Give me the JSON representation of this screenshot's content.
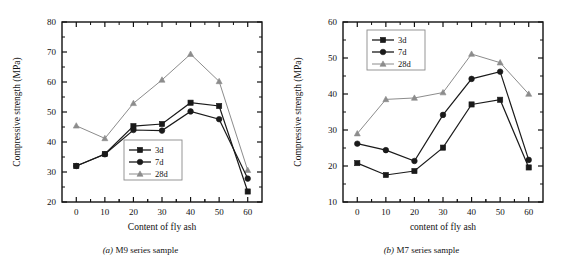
{
  "figure": {
    "background": "#ffffff",
    "ink": "#111111"
  },
  "panels": [
    {
      "key": "panel-a",
      "caption_index": "(a)",
      "caption_text": "M9 series sample",
      "chart_data": {
        "type": "line",
        "title": "",
        "xlabel": "Content of fly ash",
        "ylabel": "Compressive strength (MPa)",
        "x": [
          0,
          10,
          20,
          30,
          40,
          50,
          60
        ],
        "xlim": [
          -5,
          65
        ],
        "ylim": [
          20,
          80
        ],
        "xticks": [
          0,
          10,
          20,
          30,
          40,
          50,
          60
        ],
        "yticks": [
          20,
          30,
          40,
          50,
          60,
          70,
          80
        ],
        "grid": false,
        "legend_position": "center",
        "series": [
          {
            "name": "3d",
            "marker": "square",
            "color": "#1a1a1a",
            "values": [
              32.0,
              36.0,
              45.3,
              46.0,
              53.1,
              52.0,
              23.5
            ]
          },
          {
            "name": "7d",
            "marker": "circle",
            "color": "#1a1a1a",
            "values": [
              32.0,
              35.9,
              44.0,
              43.8,
              50.2,
              47.6,
              27.8
            ]
          },
          {
            "name": "28d",
            "marker": "triangle",
            "color": "#8c8c8c",
            "values": [
              45.4,
              41.2,
              52.9,
              60.7,
              69.3,
              60.2,
              30.6
            ]
          }
        ]
      }
    },
    {
      "key": "panel-b",
      "caption_index": "(b)",
      "caption_text": "M7 series sample",
      "chart_data": {
        "type": "line",
        "title": "",
        "xlabel": "content of fly ash",
        "ylabel": "Compressive strength (MPa)",
        "x": [
          0,
          10,
          20,
          30,
          40,
          50,
          60
        ],
        "xlim": [
          -5,
          65
        ],
        "ylim": [
          10,
          60
        ],
        "xticks": [
          0,
          10,
          20,
          30,
          40,
          50,
          60
        ],
        "yticks": [
          10,
          20,
          30,
          40,
          50,
          60
        ],
        "grid": false,
        "legend_position": "upper left",
        "series": [
          {
            "name": "3d",
            "marker": "square",
            "color": "#1a1a1a",
            "values": [
              20.8,
              17.5,
              18.6,
              25.1,
              37.1,
              38.4,
              19.6
            ]
          },
          {
            "name": "7d",
            "marker": "circle",
            "color": "#1a1a1a",
            "values": [
              26.2,
              24.4,
              21.4,
              34.2,
              44.2,
              46.2,
              21.7
            ]
          },
          {
            "name": "28d",
            "marker": "triangle",
            "color": "#8c8c8c",
            "values": [
              29.0,
              38.5,
              38.9,
              40.4,
              51.1,
              48.7,
              40.0
            ]
          }
        ]
      }
    }
  ]
}
